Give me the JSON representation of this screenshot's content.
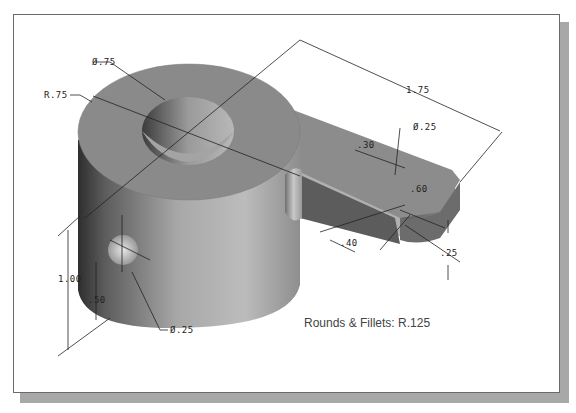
{
  "figure": {
    "type": "isometric-part-drawing",
    "colors": {
      "part_face_top": "#8a8a8a",
      "part_side_dark": "#3a3a3a",
      "part_side_light": "#c6c6c6",
      "dimension_line": "#222222",
      "frame_border": "#6a6a6a",
      "frame_shadow": "#a8a8a8"
    }
  },
  "dimensions": {
    "boss_hole_dia": "Ø.75",
    "boss_radius": "R.75",
    "overall_length": "1.75",
    "arm_hole_dia": "Ø.25",
    "arm_hole_offset": ".30",
    "arm_width_half": ".60",
    "arm_end_offset": ".40",
    "arm_thickness": ".25",
    "boss_height": "1.00",
    "side_hole_height": ".50",
    "side_hole_dia": "Ø.25"
  },
  "note": {
    "text": "Rounds & Fillets: R.125"
  }
}
